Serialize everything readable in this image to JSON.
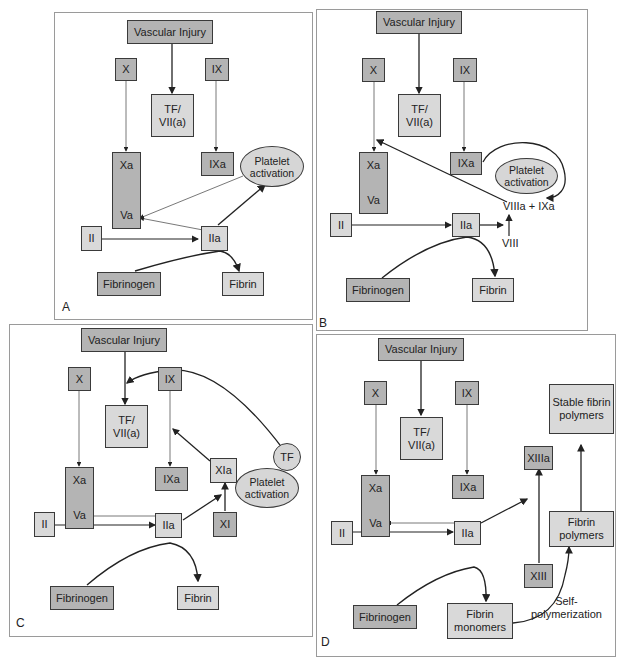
{
  "figure": {
    "panels": [
      {
        "id": "A",
        "label": "A",
        "nodes": {
          "vascular_injury": "Vascular Injury",
          "x": "X",
          "ix": "IX",
          "tf_vii": "TF/\nVII(a)",
          "xa": "Xa",
          "va": "Va",
          "ixa": "IXa",
          "platelet": "Platelet activation",
          "ii": "II",
          "iia": "IIa",
          "fibrinogen": "Fibrinogen",
          "fibrin": "Fibrin"
        }
      },
      {
        "id": "B",
        "label": "B",
        "nodes": {
          "vascular_injury": "Vascular Injury",
          "x": "X",
          "ix": "IX",
          "tf_vii": "TF/\nVII(a)",
          "xa": "Xa",
          "va": "Va",
          "ixa": "IXa",
          "platelet": "Platelet activation",
          "viiia_ixa": "VIIIa + IXa",
          "viii": "VIII",
          "ii": "II",
          "iia": "IIa",
          "fibrinogen": "Fibrinogen",
          "fibrin": "Fibrin"
        }
      },
      {
        "id": "C",
        "label": "C",
        "nodes": {
          "vascular_injury": "Vascular Injury",
          "x": "X",
          "ix": "IX",
          "tf_vii": "TF/\nVII(a)",
          "xa": "Xa",
          "va": "Va",
          "ixa": "IXa",
          "xia": "XIa",
          "xi": "XI",
          "tf": "TF",
          "platelet": "Platelet activation",
          "ii": "II",
          "iia": "IIa",
          "fibrinogen": "Fibrinogen",
          "fibrin": "Fibrin"
        }
      },
      {
        "id": "D",
        "label": "D",
        "nodes": {
          "vascular_injury": "Vascular Injury",
          "x": "X",
          "ix": "IX",
          "tf_vii": "TF/\nVII(a)",
          "xa": "Xa",
          "va": "Va",
          "ixa": "IXa",
          "stable": "Stable fibrin polymers",
          "xiiia": "XIIIa",
          "fibrin_polymers": "Fibrin polymers",
          "xiii": "XIII",
          "ii": "II",
          "iia": "IIa",
          "fibrinogen": "Fibrinogen",
          "fibrin_monomers": "Fibrin monomers",
          "self_poly": "Self-\npolymerization"
        }
      }
    ],
    "colors": {
      "dark_box": "#b4b4b4",
      "light_box": "#d9d9d9",
      "border": "#3a3a3a",
      "panel_border": "#9a9a9a"
    }
  }
}
